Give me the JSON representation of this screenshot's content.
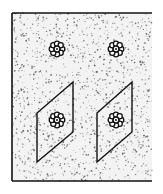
{
  "diagram": {
    "title": "",
    "colors": {
      "background": "#ffffff",
      "stipple_field": "#f3f3f3",
      "stipple_dots": "#555555",
      "ink": "#111111"
    },
    "frame": {
      "x": 12,
      "y": 13,
      "width": 140,
      "height": 168,
      "borders": [
        "top",
        "left",
        "bottom"
      ]
    },
    "flowers": [
      {
        "id": "flower-top-left",
        "cx": 57,
        "cy": 49,
        "enclosed": false
      },
      {
        "id": "flower-top-right",
        "cx": 116,
        "cy": 49,
        "enclosed": false
      },
      {
        "id": "flower-bottom-left",
        "cx": 57,
        "cy": 120,
        "enclosed": true
      },
      {
        "id": "flower-bottom-right",
        "cx": 116,
        "cy": 120,
        "enclosed": true
      }
    ],
    "parallelograms": [
      {
        "id": "parallelogram-left",
        "points": [
          [
            73,
            82
          ],
          [
            73,
            132
          ],
          [
            37,
            162
          ],
          [
            37,
            113
          ]
        ]
      },
      {
        "id": "parallelogram-right",
        "points": [
          [
            132,
            82
          ],
          [
            132,
            132
          ],
          [
            97,
            162
          ],
          [
            97,
            113
          ]
        ]
      }
    ]
  }
}
